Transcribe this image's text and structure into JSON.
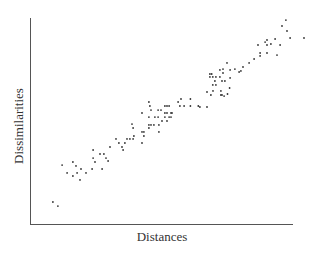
{
  "chart_data": {
    "type": "scatter",
    "title": "",
    "xlabel": "Distances",
    "ylabel": "Dissimilarities",
    "xlim": [
      0,
      100
    ],
    "ylim": [
      0,
      100
    ],
    "grid": false,
    "legend": null,
    "ticks": {
      "x": [],
      "y": []
    },
    "series": [
      {
        "name": "points",
        "color": "#333333",
        "points": [
          [
            8.7,
            10.7
          ],
          [
            10.6,
            8.7
          ],
          [
            12.2,
            28.6
          ],
          [
            14.1,
            24.8
          ],
          [
            16.3,
            30.1
          ],
          [
            17.5,
            28.2
          ],
          [
            16.3,
            23.3
          ],
          [
            17.9,
            24.8
          ],
          [
            19.4,
            26.7
          ],
          [
            19.0,
            21.4
          ],
          [
            21.3,
            24.8
          ],
          [
            24.0,
            35.9
          ],
          [
            24.0,
            32.0
          ],
          [
            24.7,
            30.1
          ],
          [
            26.6,
            34.0
          ],
          [
            23.6,
            26.7
          ],
          [
            27.4,
            26.7
          ],
          [
            28.1,
            34.0
          ],
          [
            28.9,
            32.0
          ],
          [
            29.7,
            30.6
          ],
          [
            30.4,
            37.4
          ],
          [
            32.7,
            41.3
          ],
          [
            33.8,
            39.3
          ],
          [
            35.0,
            37.4
          ],
          [
            35.4,
            35.9
          ],
          [
            36.1,
            39.3
          ],
          [
            36.9,
            41.3
          ],
          [
            38.0,
            41.3
          ],
          [
            38.8,
            48.5
          ],
          [
            39.2,
            46.6
          ],
          [
            39.5,
            42.7
          ],
          [
            39.2,
            41.3
          ],
          [
            42.6,
            53.9
          ],
          [
            42.6,
            44.7
          ],
          [
            43.3,
            44.7
          ],
          [
            43.3,
            42.7
          ],
          [
            42.6,
            39.3
          ],
          [
            45.2,
            59.2
          ],
          [
            45.6,
            57.3
          ],
          [
            46.0,
            55.3
          ],
          [
            45.2,
            51.9
          ],
          [
            45.2,
            48.1
          ],
          [
            45.2,
            46.6
          ],
          [
            46.0,
            48.1
          ],
          [
            47.1,
            48.1
          ],
          [
            47.5,
            51.9
          ],
          [
            48.7,
            55.3
          ],
          [
            49.8,
            55.3
          ],
          [
            48.7,
            51.9
          ],
          [
            49.0,
            48.1
          ],
          [
            49.0,
            44.7
          ],
          [
            50.2,
            50.0
          ],
          [
            51.3,
            51.9
          ],
          [
            51.3,
            53.9
          ],
          [
            51.3,
            57.3
          ],
          [
            52.1,
            57.3
          ],
          [
            52.9,
            57.3
          ],
          [
            52.1,
            53.9
          ],
          [
            52.1,
            50.0
          ],
          [
            52.9,
            51.9
          ],
          [
            53.6,
            51.9
          ],
          [
            53.6,
            53.9
          ],
          [
            54.0,
            53.9
          ],
          [
            57.0,
            57.3
          ],
          [
            56.3,
            59.2
          ],
          [
            57.4,
            60.7
          ],
          [
            58.6,
            57.3
          ],
          [
            61.0,
            60.7
          ],
          [
            61.0,
            57.3
          ],
          [
            64.0,
            57.3
          ],
          [
            64.6,
            56.8
          ],
          [
            67.3,
            56.8
          ],
          [
            67.3,
            64.1
          ],
          [
            68.8,
            62.6
          ],
          [
            69.6,
            64.6
          ],
          [
            72.6,
            64.6
          ],
          [
            72.6,
            62.6
          ],
          [
            73.0,
            62.6
          ],
          [
            73.8,
            62.1
          ],
          [
            75.1,
            63.1
          ],
          [
            75.9,
            66.0
          ],
          [
            68.4,
            72.8
          ],
          [
            69.1,
            72.8
          ],
          [
            68.4,
            71.4
          ],
          [
            69.5,
            71.4
          ],
          [
            70.7,
            71.4
          ],
          [
            70.3,
            69.4
          ],
          [
            70.7,
            67.5
          ],
          [
            69.5,
            67.5
          ],
          [
            72.2,
            71.4
          ],
          [
            73.4,
            73.3
          ],
          [
            73.0,
            69.4
          ],
          [
            74.1,
            69.4
          ],
          [
            73.4,
            75.2
          ],
          [
            76.1,
            74.8
          ],
          [
            76.1,
            70.9
          ],
          [
            72.2,
            74.8
          ],
          [
            74.9,
            78.2
          ],
          [
            77.9,
            75.2
          ],
          [
            79.5,
            73.8
          ],
          [
            80.2,
            74.3
          ],
          [
            81.0,
            76.2
          ],
          [
            83.3,
            78.2
          ],
          [
            85.2,
            80.1
          ],
          [
            86.7,
            86.9
          ],
          [
            87.5,
            83.0
          ],
          [
            87.5,
            81.6
          ],
          [
            90.1,
            83.0
          ],
          [
            90.1,
            86.9
          ],
          [
            89.4,
            88.3
          ],
          [
            90.1,
            89.3
          ],
          [
            91.6,
            87.4
          ],
          [
            93.2,
            89.8
          ],
          [
            95.1,
            86.9
          ],
          [
            93.9,
            82.0
          ],
          [
            95.8,
            96.1
          ],
          [
            97.3,
            99.0
          ],
          [
            97.7,
            93.7
          ],
          [
            98.9,
            90.3
          ],
          [
            104.2,
            90.3
          ]
        ]
      }
    ]
  },
  "axes": {
    "x_label": "Distances",
    "y_label": "Dissimilarities"
  }
}
